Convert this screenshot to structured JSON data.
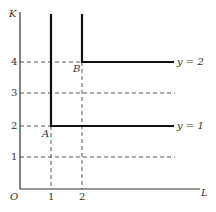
{
  "diagram": {
    "type": "isoquant-leontief",
    "axes": {
      "y_label": "K",
      "x_label": "L",
      "origin_label": "O",
      "x_ticks": [
        "1",
        "2"
      ],
      "y_ticks": [
        "1",
        "2",
        "3",
        "4"
      ]
    },
    "isoquants": [
      {
        "label": "y = 1",
        "corner_label": "A",
        "corner": {
          "L": 1,
          "K": 2
        }
      },
      {
        "label": "y = 2",
        "corner_label": "B",
        "corner": {
          "L": 2,
          "K": 4
        }
      }
    ],
    "colors": {
      "line": "#111111",
      "axis": "#333333",
      "dash": "#444444",
      "background": "#ffffff"
    }
  }
}
